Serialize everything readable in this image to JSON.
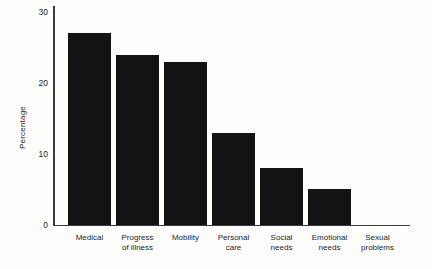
{
  "figure": {
    "background": "#fdfdfc"
  },
  "chart_data": {
    "type": "bar",
    "title": "",
    "xlabel": "",
    "ylabel": "Percentage",
    "categories": [
      "Medical",
      "Progress\nof illness",
      "Mobility",
      "Personal\ncare",
      "Social\nneeds",
      "Emotional\nneeds",
      "Sexual\nproblems"
    ],
    "values": [
      27,
      24,
      23,
      13,
      8,
      5,
      0
    ],
    "ylim": [
      0,
      30
    ],
    "yticks": [
      0,
      10,
      20,
      30
    ],
    "grid": false,
    "legend": false,
    "bar_color": "#131313",
    "axis_color": "#3a3a3a",
    "text_color": "#262626"
  }
}
